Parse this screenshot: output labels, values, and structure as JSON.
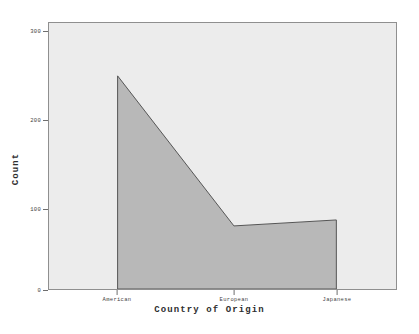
{
  "chart_data": {
    "type": "area",
    "title": "",
    "subtitle": "",
    "xlabel": "Country of Origin",
    "ylabel": "Count",
    "categories": [
      "American",
      "European",
      "Japanese"
    ],
    "values": [
      250,
      74,
      81
    ],
    "series": [
      {
        "name": "Count",
        "values": [
          250,
          74,
          81
        ]
      }
    ],
    "x_tick_labels": [
      "American",
      "European",
      "Japanese"
    ],
    "y_tick_labels": [
      "0",
      "100",
      "200",
      "300"
    ],
    "y_tick_values": [
      0,
      100,
      200,
      300
    ],
    "ylim": [
      0,
      312
    ],
    "xlim_categories": [
      "American",
      "Japanese"
    ],
    "grid": false,
    "legend": false,
    "legend_position": "none",
    "annotations": [],
    "colors": {
      "area_fill": "#b8b8b8",
      "area_outline": "#555555",
      "plot_background": "#ececec",
      "figure_background": "#ffffff",
      "axis_line": "#8f8f8f",
      "tick_mark": "#6e6e6e",
      "tick_label_text": "#3f3f3f",
      "axis_title_text": "#2e2e2e"
    }
  },
  "axes": {
    "y": {
      "title": "Count",
      "ticks": [
        {
          "label": "300",
          "value": 300
        },
        {
          "label": "200",
          "value": 200
        },
        {
          "label": "100",
          "value": 100
        },
        {
          "label": "0",
          "value": 0
        }
      ]
    },
    "x": {
      "title": "Country of Origin",
      "ticks": [
        {
          "label": "American",
          "value": 250
        },
        {
          "label": "European",
          "value": 74
        },
        {
          "label": "Japanese",
          "value": 81
        }
      ]
    }
  }
}
